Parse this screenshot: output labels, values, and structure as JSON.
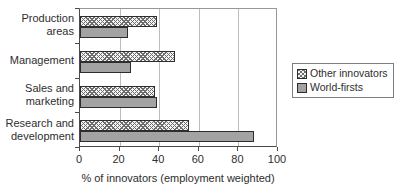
{
  "chart_data": {
    "type": "bar",
    "orientation": "horizontal",
    "title": "",
    "xlabel": "% of innovators (employment weighted)",
    "ylabel": "",
    "xlim": [
      0,
      100
    ],
    "xticks": [
      0,
      20,
      40,
      60,
      80,
      100
    ],
    "grid": true,
    "legend_position": "right-middle",
    "categories": [
      "Production\nareas",
      "Management",
      "Sales and\nmarketing",
      "Research and\ndevelopment"
    ],
    "series": [
      {
        "name": "Other innovators",
        "values": [
          39,
          48,
          38,
          55
        ],
        "fill": "hatch",
        "pattern_color": "#6d6d6d"
      },
      {
        "name": "World-firsts",
        "values": [
          24,
          26,
          39,
          88
        ],
        "fill": "solid",
        "color": "#a3a3a3"
      }
    ],
    "colors": {
      "grid": "#bdbdbd",
      "axis": "#4a4a4a",
      "bar_border": "#2d2d2d",
      "text": "#2e2e2e",
      "background": "#ffffff"
    }
  }
}
